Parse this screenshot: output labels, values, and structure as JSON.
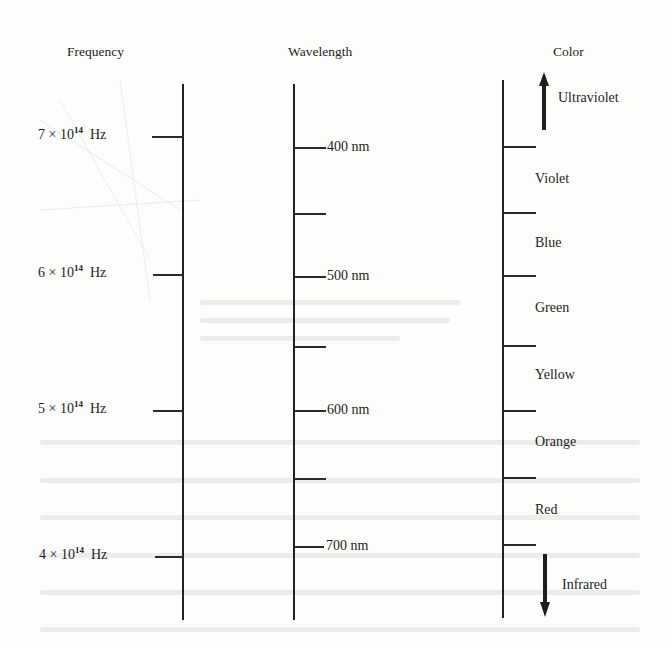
{
  "headers": {
    "frequency": "Frequency",
    "wavelength": "Wavelength",
    "color": "Color"
  },
  "frequency_ticks": [
    {
      "mantissa": "7 × 10",
      "exp": "14",
      "unit": "Hz"
    },
    {
      "mantissa": "6 × 10",
      "exp": "14",
      "unit": "Hz"
    },
    {
      "mantissa": "5 × 10",
      "exp": "14",
      "unit": "Hz"
    },
    {
      "mantissa": "4 × 10",
      "exp": "14",
      "unit": "Hz"
    }
  ],
  "wavelength_ticks": [
    {
      "label": "400 nm"
    },
    {
      "label": ""
    },
    {
      "label": "500 nm"
    },
    {
      "label": ""
    },
    {
      "label": "600 nm"
    },
    {
      "label": ""
    },
    {
      "label": "700 nm"
    }
  ],
  "color_bands": [
    {
      "label": "Violet"
    },
    {
      "label": "Blue"
    },
    {
      "label": "Green"
    },
    {
      "label": "Yellow"
    },
    {
      "label": "Orange"
    },
    {
      "label": "Red"
    }
  ],
  "color_extremes": {
    "top": {
      "label": "Ultraviolet",
      "direction": "up-arrow"
    },
    "bottom": {
      "label": "Infrared",
      "direction": "down-arrow"
    }
  },
  "colors": {
    "ink": "#1e1e1e",
    "paper": "#fdfdfb"
  }
}
